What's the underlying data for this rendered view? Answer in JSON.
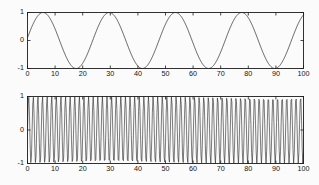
{
  "figure": {
    "background_color": "#fcfcfc",
    "axis_color": "#1c1c1c",
    "curve_color": "#2b2b2b"
  },
  "chart_data": [
    {
      "type": "line",
      "name": "top-plot",
      "title": "",
      "xlabel": "",
      "ylabel": "",
      "xlim": [
        0,
        100
      ],
      "ylim": [
        -1,
        1
      ],
      "grid": false,
      "legend": null,
      "xticks": [
        0,
        10,
        20,
        30,
        40,
        50,
        60,
        70,
        80,
        90,
        100
      ],
      "xticklabels": [
        "0",
        "10",
        "20",
        "30",
        "40",
        "50",
        "60",
        "70",
        "80",
        "90",
        "100"
      ],
      "yticks": [
        -1,
        0,
        1
      ],
      "yticklabels": [
        "-1",
        "0",
        "1"
      ],
      "series": [
        {
          "name": "low-frequency-sine",
          "description": "sin(2*pi*x/24 + 0.1) sampled finely over 0..100",
          "amplitude": 1,
          "period": 24,
          "phase": 0.1,
          "cycles_visible": 4.2,
          "x": [
            0,
            6,
            12,
            18,
            24,
            30,
            36,
            42,
            48,
            54,
            60,
            66,
            72,
            78,
            84,
            90,
            96,
            100
          ],
          "y": [
            0.1,
            1.0,
            0.1,
            -1.0,
            0.1,
            1.0,
            0.1,
            -1.0,
            0.1,
            1.0,
            0.1,
            -1.0,
            0.1,
            1.0,
            0.1,
            -1.0,
            0.1,
            0.8
          ]
        }
      ]
    },
    {
      "type": "line",
      "name": "bottom-plot",
      "title": "",
      "xlabel": "",
      "ylabel": "",
      "xlim": [
        0,
        100
      ],
      "ylim": [
        -1,
        1
      ],
      "grid": false,
      "legend": null,
      "xticks": [
        0,
        10,
        20,
        30,
        40,
        50,
        60,
        70,
        80,
        90,
        100
      ],
      "xticklabels": [
        "0",
        "10",
        "20",
        "30",
        "40",
        "50",
        "60",
        "70",
        "80",
        "90",
        "100"
      ],
      "yticks": [
        -1,
        0,
        1
      ],
      "yticklabels": [
        "-1",
        "0",
        "1"
      ],
      "series": [
        {
          "name": "high-frequency-oscillation",
          "description": "dense full-amplitude oscillation, approx 60 cycles over 0..100, sampled near Nyquist producing aliased envelope",
          "amplitude": 1,
          "period": 1.67,
          "cycles_visible": 60,
          "sample_count": 420
        }
      ]
    }
  ]
}
